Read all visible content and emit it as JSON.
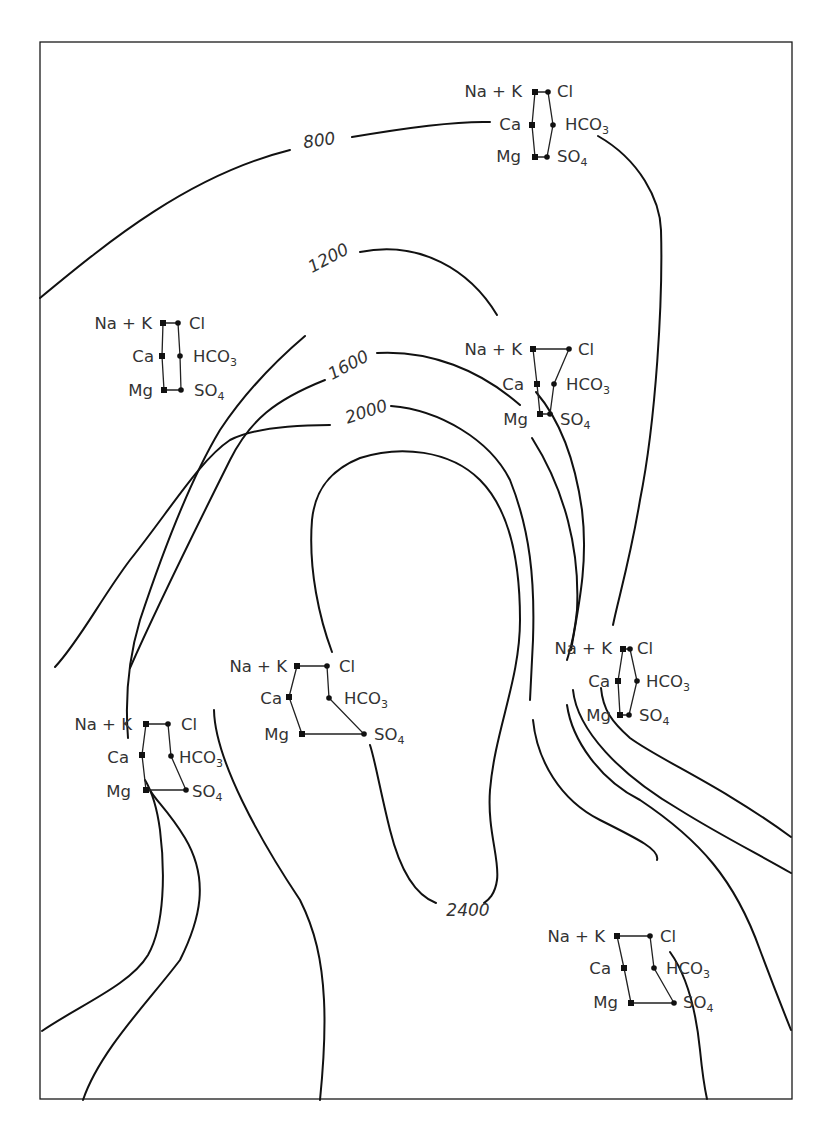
{
  "figure": {
    "type": "isopotential contour map with Stiff diagrams",
    "frame": {
      "x": 40,
      "y": 42,
      "width": 752,
      "height": 1057
    },
    "colors": {
      "line": "#111111",
      "text": "#333333",
      "background": "#ffffff"
    }
  },
  "contours": [
    {
      "value": 800,
      "label": "800",
      "label_pos": [
        320,
        146
      ],
      "label_rotate": -8,
      "path": "M 40 298 C 110 240, 190 175, 290 150 M 352 137 C 410 127, 460 121, 490 122 M 598 136 C 640 160, 660 200, 661 230 C 663 300, 656 420, 640 500 C 630 560, 618 600, 613 625 M 601 688 C 603 710, 612 722, 630 738 C 660 760, 720 785, 791 837"
    },
    {
      "value": 1200,
      "label": "1200",
      "label_pos": [
        331,
        263
      ],
      "label_rotate": -28,
      "path": "M 42 1031 C 80 1005, 130 985, 148 955 C 165 925, 165 870, 160 830 C 156 800, 148 785, 145 780 M 128 738 C 125 700, 128 660, 140 620 C 160 560, 190 480, 220 430 C 240 400, 265 370, 305 336 M 360 252 C 420 240, 470 270, 497 315 M 536 392 C 560 420, 575 460, 582 510 C 588 560, 580 600, 571 650 M 573 690 C 577 730, 620 775, 680 810 C 720 835, 760 855, 791 873"
    },
    {
      "value": 1600,
      "label": "1600",
      "label_pos": [
        351,
        370
      ],
      "label_rotate": -28,
      "path": "M 83 1100 C 100 1050, 150 1000, 180 960 C 200 920, 210 880, 185 838 C 168 810, 155 800, 150 790 M 130 668 C 160 600, 200 520, 230 460 C 250 420, 275 400, 325 380 M 377 353 C 430 350, 480 370, 520 405 M 532 438 C 565 490, 580 550, 577 610 C 574 640, 570 650, 567 660 M 567 705 C 572 740, 600 780, 640 800 C 700 840, 735 880, 760 950 C 775 990, 785 1015, 791 1030"
    },
    {
      "value": 2000,
      "label": "2000",
      "label_pos": [
        368,
        417
      ],
      "label_rotate": -18,
      "path": "M 55 667 C 80 640, 100 600, 130 560 C 170 510, 200 460, 230 440 C 250 430, 285 425, 330 425 M 391 406 C 440 410, 490 440, 510 480 C 530 530, 535 580, 533 640 C 532 660, 531 680, 530 700 M 533 720 C 537 760, 560 800, 600 820 C 640 840, 660 850, 657 860 M 214 710 C 215 760, 260 840, 300 900 C 315 930, 322 960, 324 1000 C 326 1040, 322 1080, 320 1100 M 670 952 C 690 980, 697 1020, 700 1050 C 702 1070, 705 1090, 707 1099"
    },
    {
      "value": 2400,
      "label": "2400",
      "label_pos": [
        468,
        916
      ],
      "label_rotate": 0,
      "path": "M 436 903 C 415 895, 400 870, 390 830 C 380 790, 375 760, 370 745 M 332 652 C 320 620, 308 570, 312 520 C 315 490, 330 470, 360 458 C 400 445, 450 450, 480 480 C 510 510, 520 560, 520 620 C 520 680, 495 730, 490 790 C 487 830, 500 860, 497 880 C 495 895, 488 900, 484 903"
    }
  ],
  "stiff_diagrams": [
    {
      "id": "top-center",
      "labels": {
        "nak": "Na + K",
        "ca": "Ca",
        "mg": "Mg",
        "cl": "Cl",
        "hco3": "HCO",
        "so4": "SO",
        "sub3": "3",
        "sub4": "4"
      },
      "label_anchor": {
        "nak_x": 522,
        "ca_x": 521,
        "mg_x": 521,
        "cl_x": 557,
        "hco3_x": 565,
        "so4_x": 557,
        "row1_y": 97,
        "row2_y": 130,
        "row3_y": 162
      },
      "cations": [
        [
          535,
          92
        ],
        [
          532,
          125
        ],
        [
          535,
          157
        ]
      ],
      "anions": [
        [
          548,
          92
        ],
        [
          553,
          125
        ],
        [
          547,
          157
        ]
      ]
    },
    {
      "id": "upper-left",
      "labels": {
        "nak": "Na + K",
        "ca": "Ca",
        "mg": "Mg",
        "cl": "Cl",
        "hco3": "HCO",
        "so4": "SO",
        "sub3": "3",
        "sub4": "4"
      },
      "label_anchor": {
        "nak_x": 152,
        "ca_x": 154,
        "mg_x": 153,
        "cl_x": 189,
        "hco3_x": 193,
        "so4_x": 194,
        "row1_y": 329,
        "row2_y": 362,
        "row3_y": 396
      },
      "cations": [
        [
          163,
          323
        ],
        [
          162,
          356
        ],
        [
          164,
          390
        ]
      ],
      "anions": [
        [
          178,
          323
        ],
        [
          180,
          356
        ],
        [
          181,
          390
        ]
      ]
    },
    {
      "id": "center-right",
      "labels": {
        "nak": "Na + K",
        "ca": "Ca",
        "mg": "Mg",
        "cl": "Cl",
        "hco3": "HCO",
        "so4": "SO",
        "sub3": "3",
        "sub4": "4"
      },
      "label_anchor": {
        "nak_x": 522,
        "ca_x": 524,
        "mg_x": 528,
        "cl_x": 578,
        "hco3_x": 566,
        "so4_x": 560,
        "row1_y": 355,
        "row2_y": 390,
        "row3_y": 425
      },
      "cations": [
        [
          533,
          349
        ],
        [
          537,
          384
        ],
        [
          540,
          414
        ]
      ],
      "anions": [
        [
          569,
          349
        ],
        [
          554,
          384
        ],
        [
          550,
          414
        ]
      ]
    },
    {
      "id": "center",
      "labels": {
        "nak": "Na + K",
        "ca": "Ca",
        "mg": "Mg",
        "cl": "Cl",
        "hco3": "HCO",
        "so4": "SO",
        "sub3": "3",
        "sub4": "4"
      },
      "label_anchor": {
        "nak_x": 287,
        "ca_x": 282,
        "mg_x": 289,
        "cl_x": 339,
        "hco3_x": 344,
        "so4_x": 374,
        "row1_y": 672,
        "row2_y": 704,
        "row3_y": 740
      },
      "cations": [
        [
          297,
          666
        ],
        [
          289,
          697
        ],
        [
          302,
          734
        ]
      ],
      "anions": [
        [
          327,
          666
        ],
        [
          329,
          698
        ],
        [
          364,
          734
        ]
      ]
    },
    {
      "id": "lower-left",
      "labels": {
        "nak": "Na + K",
        "ca": "Ca",
        "mg": "Mg",
        "cl": "Cl",
        "hco3": "HCO",
        "so4": "SO",
        "sub3": "3",
        "sub4": "4"
      },
      "label_anchor": {
        "nak_x": 132,
        "ca_x": 129,
        "mg_x": 131,
        "cl_x": 181,
        "hco3_x": 179,
        "so4_x": 192,
        "row1_y": 730,
        "row2_y": 763,
        "row3_y": 797
      },
      "cations": [
        [
          146,
          724
        ],
        [
          142,
          755
        ],
        [
          146,
          790
        ]
      ],
      "anions": [
        [
          168,
          724
        ],
        [
          171,
          756
        ],
        [
          186,
          790
        ]
      ]
    },
    {
      "id": "right-middle",
      "labels": {
        "nak": "Na + K",
        "ca": "Ca",
        "mg": "Mg",
        "cl": "Cl",
        "hco3": "HCO",
        "so4": "SO",
        "sub3": "3",
        "sub4": "4"
      },
      "label_anchor": {
        "nak_x": 612,
        "ca_x": 610,
        "mg_x": 611,
        "cl_x": 637,
        "hco3_x": 646,
        "so4_x": 639,
        "row1_y": 654,
        "row2_y": 687,
        "row3_y": 721
      },
      "cations": [
        [
          623,
          649
        ],
        [
          618,
          681
        ],
        [
          620,
          715
        ]
      ],
      "anions": [
        [
          630,
          649
        ],
        [
          637,
          681
        ],
        [
          629,
          715
        ]
      ]
    },
    {
      "id": "bottom-right",
      "labels": {
        "nak": "Na + K",
        "ca": "Ca",
        "mg": "Mg",
        "cl": "Cl",
        "hco3": "HCO",
        "so4": "SO",
        "sub3": "3",
        "sub4": "4"
      },
      "label_anchor": {
        "nak_x": 605,
        "ca_x": 611,
        "mg_x": 618,
        "cl_x": 660,
        "hco3_x": 666,
        "so4_x": 683,
        "row1_y": 942,
        "row2_y": 974,
        "row3_y": 1008
      },
      "cations": [
        [
          617,
          936
        ],
        [
          624,
          968
        ],
        [
          631,
          1003
        ]
      ],
      "anions": [
        [
          650,
          936
        ],
        [
          654,
          968
        ],
        [
          674,
          1003
        ]
      ]
    }
  ]
}
